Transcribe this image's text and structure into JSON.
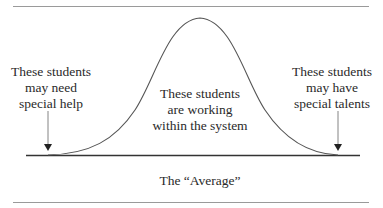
{
  "diagram": {
    "type": "bell-curve",
    "left_label": [
      "These students",
      "may need",
      "special help"
    ],
    "center_label": [
      "These students",
      "are working",
      "within the system"
    ],
    "right_label": [
      "These students",
      "may have",
      "special talents"
    ],
    "axis_label": "The “Average”",
    "colors": {
      "line": "#444444",
      "rule": "#9a9a9a",
      "text": "#2a2a2a"
    }
  }
}
